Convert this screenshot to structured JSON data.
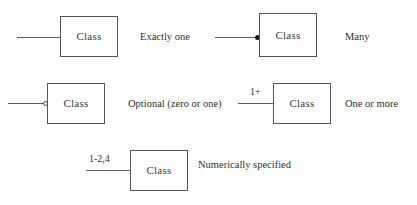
{
  "diagram": {
    "class_label": "Class",
    "colors": {
      "background": "#ffffff",
      "box_border": "#55565a",
      "line": "#5c5d60",
      "text": "#2f2f31",
      "filled_marker": "#111111"
    },
    "notations": [
      {
        "id": "exactly-one",
        "caption": "Exactly one",
        "box_label": "Class",
        "multiplicity_label": "",
        "end_marker": "none"
      },
      {
        "id": "many",
        "caption": "Many",
        "box_label": "Class",
        "multiplicity_label": "",
        "end_marker": "filled-circle"
      },
      {
        "id": "optional",
        "caption": "Optional (zero or one)",
        "box_label": "Class",
        "multiplicity_label": "",
        "end_marker": "hollow-circle"
      },
      {
        "id": "one-or-more",
        "caption": "One or more",
        "box_label": "Class",
        "multiplicity_label": "1+",
        "end_marker": "none"
      },
      {
        "id": "numerically-specified",
        "caption": "Numerically specified",
        "box_label": "Class",
        "multiplicity_label": "1-2,4",
        "end_marker": "none"
      }
    ]
  }
}
